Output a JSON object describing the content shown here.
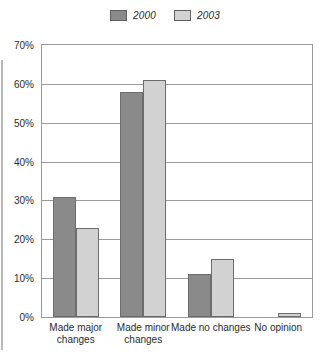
{
  "chart_data": {
    "type": "bar",
    "title": "",
    "xlabel": "",
    "ylabel": "",
    "categories": [
      "Made major changes",
      "Made minor changes",
      "Made no changes",
      "No opinion"
    ],
    "series": [
      {
        "name": "2000",
        "values": [
          31,
          58,
          11,
          0
        ],
        "color": "#8a8a8a"
      },
      {
        "name": "2003",
        "values": [
          23,
          61,
          15,
          1
        ],
        "color": "#d2d2d2"
      }
    ],
    "ylim": [
      0,
      70
    ],
    "ytick_labels": [
      "0%",
      "10%",
      "20%",
      "30%",
      "40%",
      "50%",
      "60%",
      "70%"
    ],
    "ytick_values": [
      0,
      10,
      20,
      30,
      40,
      50,
      60,
      70
    ],
    "grid": true,
    "legend_position": "top-center"
  }
}
